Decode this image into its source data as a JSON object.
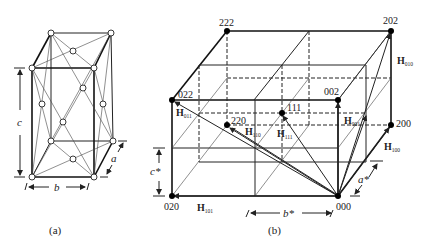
{
  "figure": {
    "panel_a": {
      "caption": "(a)",
      "axis_labels": {
        "c": "c",
        "b": "b",
        "a": "a"
      }
    },
    "panel_b": {
      "caption": "(b)",
      "points": [
        {
          "label": "222"
        },
        {
          "label": "202"
        },
        {
          "label": "022"
        },
        {
          "label": "002"
        },
        {
          "label": "111"
        },
        {
          "label": "220"
        },
        {
          "label": "200"
        },
        {
          "label": "020"
        },
        {
          "label": "000"
        }
      ],
      "vectors": [
        {
          "name": "H",
          "sub": "010"
        },
        {
          "name": "H",
          "sub": "011"
        },
        {
          "name": "H",
          "sub": "110"
        },
        {
          "name": "H",
          "sub": "111"
        },
        {
          "name": "H",
          "sub": "001"
        },
        {
          "name": "H",
          "sub": "100"
        },
        {
          "name": "H",
          "sub": "101"
        }
      ],
      "axis_labels": {
        "c_star": "c*",
        "b_star": "b*",
        "a_star": "a*"
      }
    }
  }
}
